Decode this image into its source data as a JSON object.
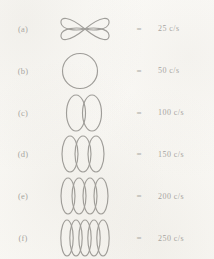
{
  "figure": {
    "background_color": "#fbfaf7",
    "ink_color": "#3d3b38",
    "equals_symbol": "=",
    "unit": "c/s",
    "rows": [
      {
        "label": "(a)",
        "equals": "=",
        "value": "25 c/s",
        "frequency": 25,
        "pattern_name": "figure-eight-lissajous",
        "lobes": 1,
        "description": "vertical figure eight, two lobes crossing at centre"
      },
      {
        "label": "(b)",
        "equals": "=",
        "value": "50 c/s",
        "frequency": 50,
        "pattern_name": "circle-lissajous",
        "lobes": 1,
        "description": "single circle"
      },
      {
        "label": "(c)",
        "equals": "=",
        "value": "100 c/s",
        "frequency": 100,
        "pattern_name": "two-loop-lissajous",
        "lobes": 2,
        "description": "two tall ellipses side by side"
      },
      {
        "label": "(d)",
        "equals": "=",
        "value": "150 c/s",
        "frequency": 150,
        "pattern_name": "three-loop-lissajous",
        "lobes": 3,
        "description": "three tall ellipses side by side"
      },
      {
        "label": "(e)",
        "equals": "=",
        "value": "200 c/s",
        "frequency": 200,
        "pattern_name": "four-loop-lissajous",
        "lobes": 4,
        "description": "four tall ellipses side by side"
      },
      {
        "label": "(f)",
        "equals": "=",
        "value": "250 c/s",
        "frequency": 250,
        "pattern_name": "five-loop-lissajous",
        "lobes": 5,
        "description": "five tall ellipses side by side"
      }
    ]
  }
}
